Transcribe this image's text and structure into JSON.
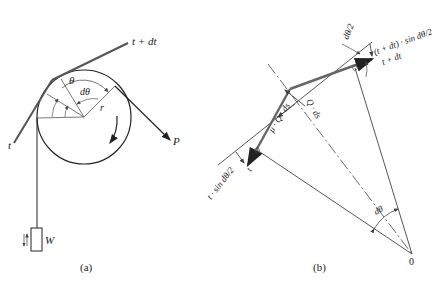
{
  "figure": {
    "panels": [
      {
        "id": "a",
        "caption": "(a)",
        "description": "Belt wrapped over a pulley with weight W hanging on the slack side and pull P on the tight side",
        "labels": {
          "tension_in": "t",
          "tension_out": "t + dt",
          "angle": "θ",
          "angle_element": "dθ",
          "radius": "r",
          "pull_force": "P",
          "weight": "W"
        }
      },
      {
        "id": "b",
        "caption": "(b)",
        "description": "Free-body diagram of a belt element subtending angle dθ at center 0",
        "labels": {
          "tension_in": "t",
          "tension_out": "t + dt",
          "normal_force": "Q · ds",
          "friction_force": "μ · Q · ds",
          "center": "0",
          "angle_element": "dθ",
          "half_angle_left": "dθ/2",
          "half_angle_right": "dθ/2",
          "component_in": "t · sin dθ/2",
          "component_out": "(t + dt) · sin dθ/2"
        }
      }
    ]
  },
  "colors": {
    "line": "#333333",
    "belt": "#555555",
    "background": "#ffffff"
  }
}
